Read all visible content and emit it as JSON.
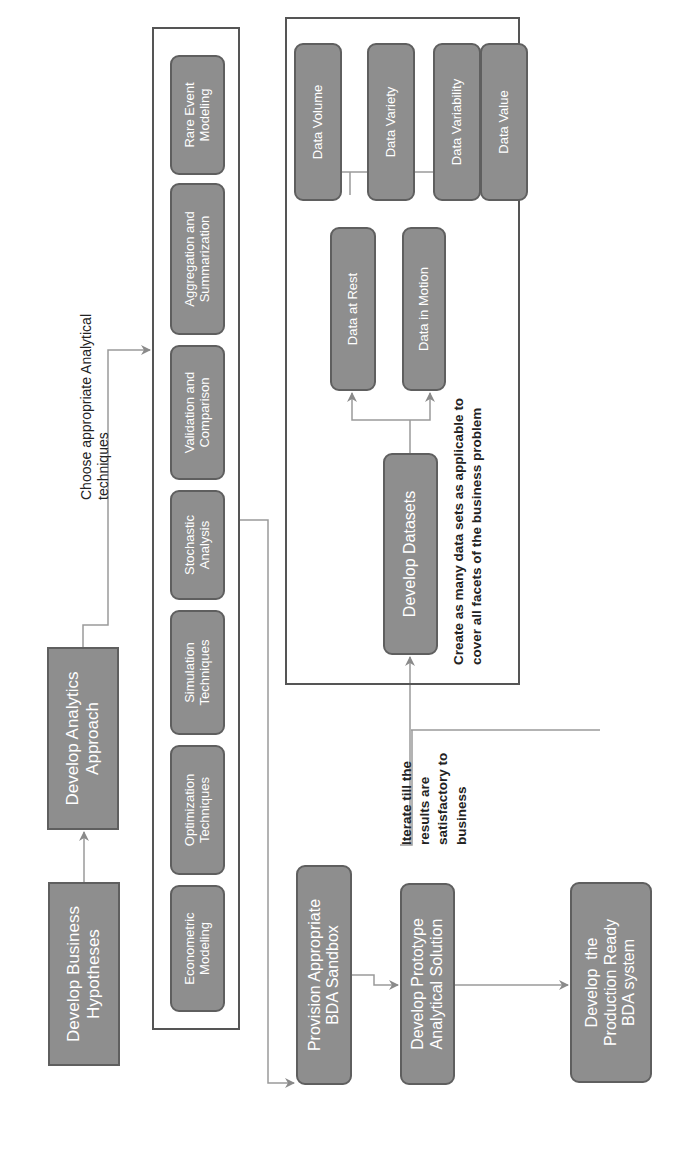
{
  "diagram": {
    "orientation": "rotated 90 degrees counter-clockwise",
    "colors": {
      "node_fill": "#8e8e8e",
      "node_border": "#5f5f5f",
      "node_text": "#ffffff",
      "frame_border": "#555555",
      "connector": "#9a9a9a",
      "note_text": "#222222"
    },
    "main_flow": {
      "hypotheses": "Develop Business Hypotheses",
      "hypotheses_lines": [
        "Develop Business",
        "Hypotheses"
      ],
      "approach_lines": [
        "Develop Analytics",
        "Approach"
      ],
      "sandbox_lines": [
        "Provision Appropriate",
        "BDA Sandbox"
      ],
      "prototype_lines": [
        "Develop Prototype",
        "Analytical Solution"
      ],
      "production_lines": [
        "Develop  the",
        "Production Ready",
        "BDA system"
      ]
    },
    "techniques": {
      "label_lines": [
        "Choose appropriate Analytical",
        "techniques"
      ],
      "items": [
        {
          "lines": [
            "Econometric",
            "Modeling"
          ]
        },
        {
          "lines": [
            "Optimization",
            "Techniques"
          ]
        },
        {
          "lines": [
            "Simulation",
            "Techniques"
          ]
        },
        {
          "lines": [
            "Stochastic",
            "Analysis"
          ]
        },
        {
          "lines": [
            "Validation and",
            "Comparison"
          ]
        },
        {
          "lines": [
            "Aggregation and",
            "Summarization"
          ]
        },
        {
          "lines": [
            "Rare Event",
            "Modeling"
          ]
        }
      ]
    },
    "iterate_note_lines": [
      "Iterate till the",
      "results are",
      "satisfactory to",
      "business"
    ],
    "datasets": {
      "develop": "Develop Datasets",
      "at_rest": "Data at Rest",
      "in_motion": "Data in Motion",
      "facets": [
        "Data Volume",
        "Data Variety",
        "Data Variability",
        "Data Value"
      ],
      "note_lines": [
        "Create as many data sets as applicable to",
        "cover all facets of the business problem"
      ]
    }
  }
}
